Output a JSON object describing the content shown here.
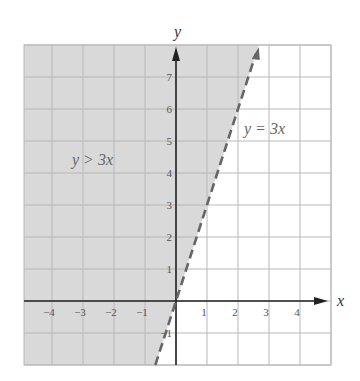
{
  "chart_data": {
    "type": "line",
    "title": "",
    "xlabel": "x",
    "ylabel": "y",
    "xlim": [
      -5,
      5
    ],
    "ylim": [
      -2,
      8
    ],
    "grid": true,
    "x_ticks": [
      -4,
      -3,
      -2,
      -1,
      1,
      2,
      3,
      4
    ],
    "y_ticks": [
      1,
      2,
      3,
      4,
      5,
      6,
      7
    ],
    "series": [
      {
        "name": "y = 3x",
        "style": "dashed",
        "equation": "y = 3x",
        "x": [
          -0.6,
          2.67
        ],
        "y": [
          -1.8,
          8
        ]
      }
    ],
    "shaded_region": {
      "inequality": "y > 3x",
      "side": "above-left of line",
      "boundary": "dashed (not included)"
    },
    "annotations": [
      {
        "text": "y > 3x",
        "x": -3.3,
        "y": 4.6
      },
      {
        "text": "y = 3x",
        "x": 3.0,
        "y": 5.6
      }
    ]
  },
  "labels": {
    "x_axis": "x",
    "y_axis": "y",
    "region": "y > 3x",
    "line": "y = 3x"
  },
  "colors": {
    "shade": "#d9d9d9",
    "grid": "#b8b8b8",
    "axis": "#222222",
    "line": "#666666"
  }
}
